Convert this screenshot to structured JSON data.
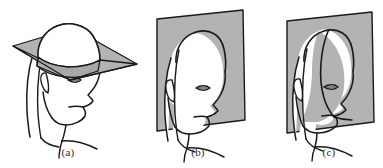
{
  "figure": {
    "background_color": "#ffffff",
    "plane_fill_color": "#b3b3b3",
    "plane_fill_color_shaded": "#a8a8a8",
    "outline_color": "#1a1a1a",
    "caption_color": "#2b2b2b",
    "panel_count": 3
  },
  "panels": [
    {
      "id": "panel-a",
      "caption": "(a)",
      "plane_name": "transverse-plane",
      "plane_orientation": "horizontal",
      "description": "Horizontal (transverse/axial) plane passing through the upper skull, shown as a parallelogram seen edge-on with the elliptical intersection band visible on the cranium.",
      "subject": "head-three-quarter-view",
      "features": [
        "skull-dome",
        "ear",
        "eye",
        "nose",
        "mouth",
        "chin",
        "jaw",
        "neck",
        "hair",
        "shoulder"
      ]
    },
    {
      "id": "panel-b",
      "caption": "(b)",
      "plane_name": "sagittal-plane",
      "plane_orientation": "vertical-parallel-to-view",
      "description": "Vertical (sagittal) plane standing behind the head, shown as a tilted rectangle; the head silhouette is drawn entirely in front of the plane.",
      "subject": "head-three-quarter-view",
      "features": [
        "skull-dome",
        "ear",
        "eye",
        "nose",
        "mouth",
        "chin",
        "jaw",
        "neck",
        "hair",
        "shoulder"
      ]
    },
    {
      "id": "panel-c",
      "caption": "(c)",
      "plane_name": "coronal-plane",
      "plane_orientation": "vertical-cutting-through-face",
      "description": "Vertical (coronal/frontal) plane cutting through the head; the intersection curve runs over the forehead, down past the eye and across the cheek and jaw so part of the face lies behind the plane.",
      "subject": "head-three-quarter-view",
      "features": [
        "skull-dome",
        "ear",
        "eye",
        "nose",
        "mouth",
        "chin",
        "jaw",
        "neck",
        "hair",
        "shoulder",
        "plane-intersection-curve"
      ]
    }
  ]
}
